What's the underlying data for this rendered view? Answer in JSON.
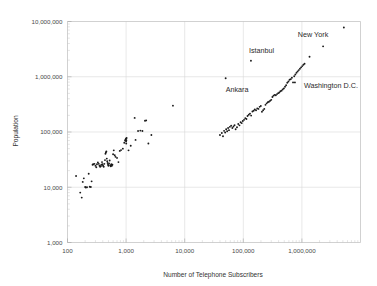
{
  "chart_data": {
    "type": "scatter",
    "title": "",
    "xlabel": "Number of Telephone Subscribers",
    "ylabel": "Population",
    "xscale": "log",
    "yscale": "log",
    "xlim": [
      100,
      10000000
    ],
    "ylim": [
      1000,
      10000000
    ],
    "grid": true,
    "legend": null,
    "xticks": [
      "100",
      "1,000",
      "10,000",
      "100,000",
      "1,000,000"
    ],
    "xtick_values": [
      100,
      1000,
      10000,
      100000,
      1000000
    ],
    "yticks": [
      "1,000",
      "10,000",
      "100,000",
      "1,000,000",
      "10,000,000"
    ],
    "ytick_values": [
      1000,
      10000,
      100000,
      1000000,
      10000000
    ],
    "marker": "dot",
    "marker_color": "#1a1a1a",
    "grid_color": "#d8d8d8",
    "annotations": [
      {
        "label": "New York",
        "x": 5200000,
        "y": 7800000,
        "label_dx": -46,
        "label_dy": 10
      },
      {
        "label": "Istanbul",
        "x": 135000,
        "y": 1950000,
        "label_dx": -2,
        "label_dy": -8
      },
      {
        "label": "Ankara",
        "x": 50000,
        "y": 940000,
        "label_dx": 0,
        "label_dy": 14
      },
      {
        "label": "Washington D.C.",
        "x": 760000,
        "y": 790000,
        "label_dx": 9,
        "label_dy": 6
      }
    ],
    "points": [
      [
        140,
        16000
      ],
      [
        165,
        8000
      ],
      [
        175,
        6500
      ],
      [
        182,
        12500
      ],
      [
        190,
        14500
      ],
      [
        200,
        10100
      ],
      [
        205,
        9900
      ],
      [
        215,
        10000
      ],
      [
        230,
        17500
      ],
      [
        240,
        10200
      ],
      [
        250,
        10100
      ],
      [
        258,
        12800
      ],
      [
        268,
        25500
      ],
      [
        275,
        26000
      ],
      [
        288,
        26500
      ],
      [
        300,
        24500
      ],
      [
        310,
        23000
      ],
      [
        318,
        26000
      ],
      [
        330,
        28000
      ],
      [
        342,
        26500
      ],
      [
        352,
        24500
      ],
      [
        360,
        23500
      ],
      [
        370,
        24000
      ],
      [
        378,
        25500
      ],
      [
        388,
        28500
      ],
      [
        396,
        26000
      ],
      [
        404,
        24500
      ],
      [
        415,
        23500
      ],
      [
        425,
        26500
      ],
      [
        436,
        31000
      ],
      [
        444,
        40500
      ],
      [
        452,
        42500
      ],
      [
        460,
        44500
      ],
      [
        468,
        33000
      ],
      [
        476,
        29500
      ],
      [
        484,
        27500
      ],
      [
        492,
        25500
      ],
      [
        500,
        24500
      ],
      [
        512,
        27000
      ],
      [
        524,
        30500
      ],
      [
        536,
        25000
      ],
      [
        548,
        24000
      ],
      [
        560,
        26000
      ],
      [
        572,
        24500
      ],
      [
        584,
        25500
      ],
      [
        600,
        39500
      ],
      [
        616,
        46500
      ],
      [
        640,
        38000
      ],
      [
        660,
        35500
      ],
      [
        700,
        34000
      ],
      [
        740,
        28500
      ],
      [
        780,
        45500
      ],
      [
        820,
        47000
      ],
      [
        880,
        50000
      ],
      [
        930,
        64000
      ],
      [
        960,
        70000
      ],
      [
        980,
        73000
      ],
      [
        995,
        76000
      ],
      [
        1000,
        68000
      ],
      [
        1005,
        62000
      ],
      [
        1010,
        71000
      ],
      [
        1020,
        78000
      ],
      [
        1100,
        46500
      ],
      [
        1200,
        56500
      ],
      [
        1400,
        180000
      ],
      [
        1450,
        72000
      ],
      [
        1600,
        104000
      ],
      [
        1750,
        106000
      ],
      [
        1900,
        104000
      ],
      [
        2100,
        160000
      ],
      [
        2200,
        162000
      ],
      [
        2400,
        62000
      ],
      [
        2700,
        88000
      ],
      [
        6300,
        300000
      ],
      [
        40000,
        88000
      ],
      [
        43000,
        96000
      ],
      [
        45000,
        84000
      ],
      [
        47000,
        105000
      ],
      [
        49000,
        98000
      ],
      [
        51000,
        112000
      ],
      [
        53000,
        103000
      ],
      [
        55000,
        118000
      ],
      [
        57000,
        108000
      ],
      [
        59000,
        124000
      ],
      [
        62000,
        130000
      ],
      [
        65000,
        118000
      ],
      [
        68000,
        126000
      ],
      [
        71000,
        133000
      ],
      [
        74000,
        112000
      ],
      [
        78000,
        122000
      ],
      [
        82000,
        140000
      ],
      [
        86000,
        132000
      ],
      [
        90000,
        150000
      ],
      [
        94000,
        145000
      ],
      [
        98000,
        158000
      ],
      [
        103000,
        166000
      ],
      [
        108000,
        178000
      ],
      [
        113000,
        172000
      ],
      [
        118000,
        195000
      ],
      [
        124000,
        205000
      ],
      [
        130000,
        215000
      ],
      [
        136000,
        198000
      ],
      [
        143000,
        235000
      ],
      [
        150000,
        242000
      ],
      [
        157000,
        255000
      ],
      [
        165000,
        248000
      ],
      [
        173000,
        268000
      ],
      [
        181000,
        262000
      ],
      [
        190000,
        285000
      ],
      [
        199000,
        295000
      ],
      [
        208000,
        232000
      ],
      [
        218000,
        248000
      ],
      [
        228000,
        262000
      ],
      [
        239000,
        310000
      ],
      [
        250000,
        330000
      ],
      [
        262000,
        345000
      ],
      [
        274000,
        352000
      ],
      [
        287000,
        368000
      ],
      [
        300000,
        382000
      ],
      [
        314000,
        430000
      ],
      [
        328000,
        455000
      ],
      [
        343000,
        470000
      ],
      [
        359000,
        462000
      ],
      [
        376000,
        485000
      ],
      [
        393000,
        505000
      ],
      [
        411000,
        520000
      ],
      [
        430000,
        545000
      ],
      [
        450000,
        560000
      ],
      [
        470000,
        590000
      ],
      [
        492000,
        615000
      ],
      [
        515000,
        660000
      ],
      [
        538000,
        700000
      ],
      [
        563000,
        780000
      ],
      [
        589000,
        820000
      ],
      [
        616000,
        880000
      ],
      [
        645000,
        905000
      ],
      [
        675000,
        960000
      ],
      [
        706000,
        790000
      ],
      [
        739000,
        1020000
      ],
      [
        773000,
        1100000
      ],
      [
        809000,
        1180000
      ],
      [
        846000,
        1250000
      ],
      [
        885000,
        1320000
      ],
      [
        926000,
        1400000
      ],
      [
        969000,
        1480000
      ],
      [
        1014000,
        1560000
      ],
      [
        1061000,
        1650000
      ],
      [
        1110000,
        1720000
      ],
      [
        1350000,
        2300000
      ],
      [
        2300000,
        3550000
      ],
      [
        5200000,
        7800000
      ],
      [
        50000,
        940000
      ],
      [
        135000,
        1950000
      ],
      [
        760000,
        790000
      ]
    ]
  }
}
